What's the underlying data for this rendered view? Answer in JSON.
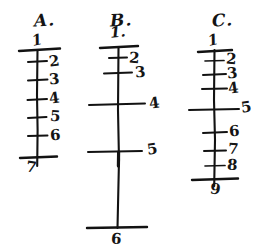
{
  "figure": {
    "background_color": "#ffffff",
    "ink_color": "#121212",
    "medium": "handwritten pen on white paper"
  },
  "panels": [
    {
      "id": "A",
      "letter": "A.",
      "top_number": "1",
      "bottom_number": "7",
      "rungs": [
        {
          "label": "1",
          "position": "top-cap"
        },
        {
          "label": "2",
          "position": "rung"
        },
        {
          "label": "3",
          "position": "rung"
        },
        {
          "label": "4",
          "position": "rung"
        },
        {
          "label": "5",
          "position": "rung"
        },
        {
          "label": "6",
          "position": "rung"
        },
        {
          "label": "7",
          "position": "bottom-cap"
        }
      ],
      "labels": [
        "1",
        "2",
        "3",
        "4",
        "5",
        "6",
        "7"
      ],
      "count": 7
    },
    {
      "id": "B",
      "letter": "B.",
      "top_number": "1.",
      "bottom_number": "6",
      "rungs": [
        {
          "label": "1.",
          "position": "top-cap"
        },
        {
          "label": "2",
          "position": "rung"
        },
        {
          "label": "3",
          "position": "rung"
        },
        {
          "label": "4",
          "position": "rung"
        },
        {
          "label": "5",
          "position": "rung"
        },
        {
          "label": "6",
          "position": "bottom-cap"
        }
      ],
      "labels": [
        "1.",
        "2",
        "3",
        "4",
        "5",
        "6"
      ],
      "count": 6
    },
    {
      "id": "C",
      "letter": "C.",
      "top_number": "1",
      "bottom_number": "9",
      "rungs": [
        {
          "label": "1",
          "position": "top-cap"
        },
        {
          "label": "2",
          "position": "rung"
        },
        {
          "label": "3",
          "position": "rung"
        },
        {
          "label": "4",
          "position": "rung"
        },
        {
          "label": "5",
          "position": "rung"
        },
        {
          "label": "6",
          "position": "rung"
        },
        {
          "label": "7",
          "position": "rung"
        },
        {
          "label": "8",
          "position": "rung"
        },
        {
          "label": "9",
          "position": "bottom-cap"
        }
      ],
      "labels": [
        "1",
        "2",
        "3",
        "4",
        "5",
        "6",
        "7",
        "8",
        "9"
      ],
      "count": 9
    }
  ]
}
